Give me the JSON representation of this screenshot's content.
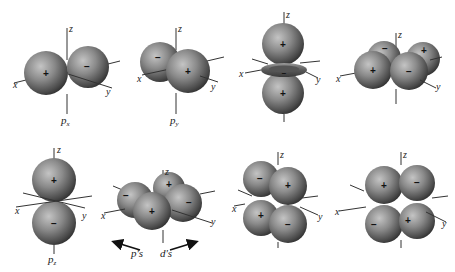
{
  "figure": {
    "axis_labels": {
      "x": "x",
      "y": "y",
      "z": "z"
    },
    "orbitals": [
      {
        "id": "px",
        "caption_main": "p",
        "caption_sub": "x",
        "lobes": [
          {
            "sign": "+"
          },
          {
            "sign": "−"
          }
        ]
      },
      {
        "id": "py",
        "caption_main": "p",
        "caption_sub": "y",
        "lobes": [
          {
            "sign": "−"
          },
          {
            "sign": "+"
          }
        ]
      },
      {
        "id": "dz2",
        "caption_main": "",
        "caption_sub": "",
        "lobes": [
          {
            "sign": "+"
          },
          {
            "sign": "−"
          },
          {
            "sign": "+"
          }
        ]
      },
      {
        "id": "dxy",
        "caption_main": "",
        "caption_sub": "",
        "lobes": [
          {
            "sign": "−"
          },
          {
            "sign": "+"
          },
          {
            "sign": "+"
          },
          {
            "sign": "−"
          }
        ]
      },
      {
        "id": "pz",
        "caption_main": "p",
        "caption_sub": "z",
        "lobes": [
          {
            "sign": "+"
          },
          {
            "sign": "−"
          }
        ]
      },
      {
        "id": "dx2y2",
        "caption_main": "",
        "caption_sub": "",
        "lobes": [
          {
            "sign": "−"
          },
          {
            "sign": "+"
          },
          {
            "sign": "−"
          },
          {
            "sign": "+"
          }
        ]
      },
      {
        "id": "dyz",
        "caption_main": "",
        "caption_sub": "",
        "lobes": [
          {
            "sign": "−"
          },
          {
            "sign": "+"
          },
          {
            "sign": "+"
          },
          {
            "sign": "−"
          }
        ]
      },
      {
        "id": "dxz",
        "caption_main": "",
        "caption_sub": "",
        "lobes": [
          {
            "sign": "+"
          },
          {
            "sign": "−"
          },
          {
            "sign": "−"
          },
          {
            "sign": "+"
          }
        ]
      }
    ],
    "arrows": {
      "left_label": "p's",
      "right_label": "d's"
    }
  },
  "colors": {
    "sphere_light": "#b8b8b8",
    "sphere_mid": "#7a7a7a",
    "sphere_dark": "#3c3c3c",
    "axis": "#333333"
  }
}
